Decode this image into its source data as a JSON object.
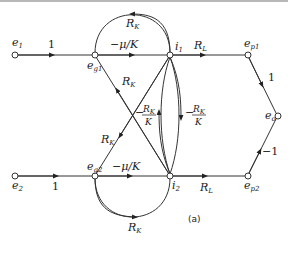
{
  "figure": {
    "caption": "(a)",
    "nodes": {
      "e1": {
        "main": "e",
        "sub": "1"
      },
      "eg1": {
        "main": "e",
        "sub": "g1"
      },
      "i1": {
        "main": "i",
        "sub": "1"
      },
      "ep1": {
        "main": "e",
        "sub": "p1"
      },
      "eo": {
        "main": "e",
        "sub": "o"
      },
      "ep2": {
        "main": "e",
        "sub": "p2"
      },
      "i2": {
        "main": "i",
        "sub": "2"
      },
      "eg2": {
        "main": "e",
        "sub": "g2"
      },
      "e2": {
        "main": "e",
        "sub": "2"
      }
    },
    "branches": {
      "e1_eg1": "1",
      "eg1_i1": "−μ/K",
      "i1_eg1_loop": "R",
      "i1_eg1_loop_sub": "K",
      "i1_ep1": "R",
      "i1_ep1_sub": "L",
      "ep1_eo": "1",
      "ep2_eo": "−1",
      "e2_eg2": "1",
      "eg2_i2": "−μ/K",
      "i2_eg2_loop": "R",
      "i2_eg2_loop_sub": "K",
      "i2_ep2": "R",
      "i2_ep2_sub": "L",
      "i2_eg1": "R",
      "i2_eg1_sub": "K",
      "i1_eg2": "R",
      "i1_eg2_sub": "K",
      "i2_i1_num": "R",
      "i2_i1_num_sub": "K",
      "i2_i1_den": "K",
      "i1_i2_num": "R",
      "i1_i2_num_sub": "K",
      "i1_i2_den": "K",
      "minus": "−"
    }
  }
}
